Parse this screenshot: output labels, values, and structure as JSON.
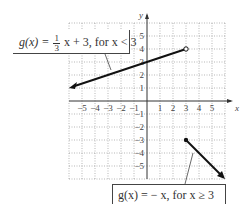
{
  "chart_data": {
    "type": "line",
    "title": "",
    "xlabel": "x",
    "ylabel": "y",
    "xlim": [
      -6,
      6
    ],
    "ylim": [
      -6,
      6
    ],
    "grid": true,
    "x_ticks": [
      "-5",
      "-4",
      "-3",
      "-2",
      "-1",
      "1",
      "2",
      "3",
      "4",
      "5"
    ],
    "y_ticks": [
      "5",
      "4",
      "3",
      "2",
      "1",
      "-1",
      "-2",
      "-3",
      "-4",
      "-5"
    ],
    "series": [
      {
        "name": "g(x) = (1/3)x + 3, for x < 3",
        "points": [
          [
            -6,
            1
          ],
          [
            3,
            4
          ]
        ],
        "start_arrow": true,
        "end_marker": "open circle at (3, 4)"
      },
      {
        "name": "g(x) = -x, for x ≥ 3",
        "points": [
          [
            3,
            -3
          ],
          [
            6,
            -6
          ]
        ],
        "start_marker": "closed dot at (3, -3)",
        "end_arrow": true
      }
    ],
    "annotations": [
      "g(x) = 1/3 x + 3, for x < 3",
      "g(x) = −x, for x ≥ 3"
    ]
  },
  "labels": {
    "piece1_prefix": "g(x) = ",
    "piece1_num": "1",
    "piece1_den": "3",
    "piece1_suffix": " x + 3, for x < 3",
    "piece2": "g(x) = − x, for x ≥ 3",
    "x_axis": "x",
    "y_axis": "y"
  }
}
